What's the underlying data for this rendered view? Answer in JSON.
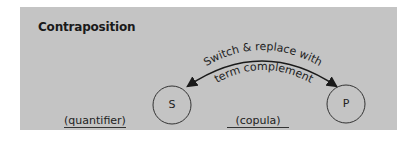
{
  "diagram": {
    "title": "Contraposition",
    "arc_label_line1": "Switch & replace with",
    "arc_label_line2": "term complement",
    "nodes": [
      {
        "id": "subject",
        "label": "S"
      },
      {
        "id": "predicate",
        "label": "P"
      }
    ],
    "blanks": [
      {
        "id": "quantifier",
        "label": "(quantifier)"
      },
      {
        "id": "copula",
        "label": "(copula)"
      }
    ],
    "colors": {
      "panel": "#c4c4c4",
      "ink": "#222222",
      "background": "#ffffff"
    }
  }
}
